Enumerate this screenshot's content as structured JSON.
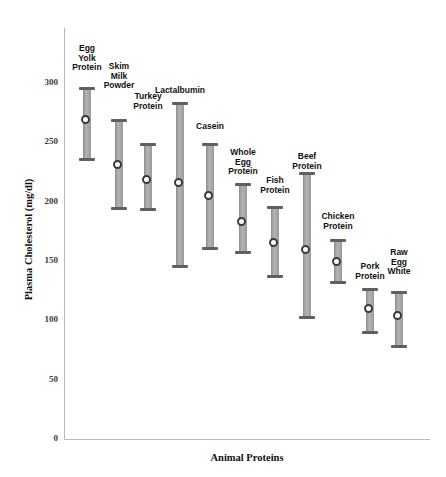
{
  "chart_data": {
    "type": "bar",
    "subtype": "range-with-mean-marker",
    "title": "",
    "xlabel": "Animal Proteins",
    "ylabel": "Plasma Cholesterol (mg/dl)",
    "ylim": [
      0,
      300
    ],
    "yticks": [
      0,
      50,
      100,
      150,
      200,
      250,
      300
    ],
    "ytick_labels": [
      "0",
      "50",
      "100",
      "150",
      "200",
      "250",
      "300"
    ],
    "grid": false,
    "legend": "none",
    "categories": [
      "Egg\nYolk\nProtein",
      "Skim\nMilk\nPowder",
      "Turkey\nProtein",
      "Lactalbumin",
      "Casein",
      "Whole\nEgg\nProtein",
      "Fish\nProtein",
      "Beef\nProtein",
      "Chicken\nProtein",
      "Pork\nProtein",
      "Raw\nEgg\nWhite"
    ],
    "series": [
      {
        "name": "mean",
        "values": [
          268,
          230,
          218,
          215,
          204,
          182,
          165,
          159,
          149,
          109,
          103
        ]
      },
      {
        "name": "upper",
        "values": [
          295,
          268,
          248,
          282,
          248,
          214,
          195,
          223,
          167,
          126,
          123
        ]
      },
      {
        "name": "lower",
        "values": [
          234,
          193,
          192,
          144,
          159,
          156,
          136,
          101,
          131,
          89,
          77
        ]
      }
    ],
    "points": [
      {
        "category": "Egg Yolk Protein",
        "label": "Egg\nYolk\nProtein",
        "mean": 268,
        "upper": 295,
        "lower": 234
      },
      {
        "category": "Skim Milk Powder",
        "label": "Skim\nMilk\nPowder",
        "mean": 230,
        "upper": 268,
        "lower": 193
      },
      {
        "category": "Turkey Protein",
        "label": "Turkey\nProtein",
        "mean": 218,
        "upper": 248,
        "lower": 192
      },
      {
        "category": "Lactalbumin",
        "label": "Lactalbumin",
        "mean": 215,
        "upper": 282,
        "lower": 144
      },
      {
        "category": "Casein",
        "label": "Casein",
        "mean": 204,
        "upper": 248,
        "lower": 159
      },
      {
        "category": "Whole Egg Protein",
        "label": "Whole\nEgg\nProtein",
        "mean": 182,
        "upper": 214,
        "lower": 156
      },
      {
        "category": "Fish Protein",
        "label": "Fish\nProtein",
        "mean": 165,
        "upper": 195,
        "lower": 136
      },
      {
        "category": "Beef Protein",
        "label": "Beef\nProtein",
        "mean": 159,
        "upper": 223,
        "lower": 101
      },
      {
        "category": "Chicken Protein",
        "label": "Chicken\nProtein",
        "mean": 149,
        "upper": 167,
        "lower": 131
      },
      {
        "category": "Pork Protein",
        "label": "Pork\nProtein",
        "mean": 109,
        "upper": 126,
        "lower": 89
      },
      {
        "category": "Raw Egg White",
        "label": "Raw\nEgg\nWhite",
        "mean": 103,
        "upper": 123,
        "lower": 77
      }
    ],
    "colors": {
      "bar": "#9f9f9f",
      "cap": "#5f5f5f",
      "marker_edge": "#3b3b3b",
      "marker_fill": "#ffffff",
      "axis": "#b9b9b9",
      "text": "#111111",
      "background": "#ffffff"
    }
  },
  "layout": {
    "plot_left": 64,
    "plot_right": 430,
    "plot_top": 28,
    "plot_bottom": 439,
    "series_x": [
      72,
      104,
      133,
      165,
      195,
      228,
      260,
      292,
      323,
      355,
      384
    ],
    "label_top": [
      44,
      62,
      92,
      86,
      122,
      148,
      176,
      152,
      212,
      262,
      248
    ]
  }
}
